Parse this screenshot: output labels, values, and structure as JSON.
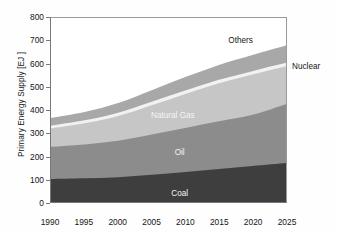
{
  "chart_data": {
    "type": "area",
    "stacked": true,
    "title": "",
    "xlabel": "",
    "ylabel": "Primary Energy Supply [EJ ]",
    "x": [
      1990,
      1995,
      2000,
      2005,
      2010,
      2015,
      2020,
      2025
    ],
    "xlim": [
      1990,
      2025
    ],
    "ylim": [
      0,
      800
    ],
    "yticks": [
      0,
      100,
      200,
      300,
      400,
      500,
      600,
      700,
      800
    ],
    "xticks": [
      1990,
      1995,
      2000,
      2005,
      2010,
      2015,
      2020,
      2025
    ],
    "grid": false,
    "legend": "inline-labels",
    "series": [
      {
        "name": "Coal",
        "color": "#3e3e3e",
        "values": [
          100,
          103,
          108,
          118,
          130,
          143,
          157,
          170
        ]
      },
      {
        "name": "Oil",
        "color": "#8c8c8c",
        "values": [
          140,
          147,
          158,
          175,
          192,
          208,
          222,
          255
        ]
      },
      {
        "name": "Natural Gas",
        "color": "#c6c6c6",
        "values": [
          80,
          92,
          108,
          128,
          148,
          165,
          175,
          165
        ]
      },
      {
        "name": "Nuclear",
        "color": "#f2f2f2",
        "values": [
          12,
          13,
          14,
          15,
          15,
          15,
          15,
          15
        ]
      },
      {
        "name": "Others",
        "color": "#a8a8a8",
        "values": [
          33,
          36,
          42,
          50,
          58,
          65,
          70,
          75
        ]
      }
    ],
    "cumulative_top": {
      "Coal": [
        100,
        103,
        108,
        118,
        130,
        143,
        157,
        170
      ],
      "Oil": [
        240,
        250,
        266,
        293,
        322,
        351,
        379,
        425
      ],
      "Natural Gas": [
        320,
        342,
        374,
        421,
        470,
        516,
        554,
        590
      ],
      "Nuclear": [
        332,
        355,
        388,
        436,
        485,
        531,
        569,
        605
      ],
      "Others": [
        365,
        391,
        430,
        486,
        543,
        596,
        639,
        680
      ]
    },
    "annotations": [
      {
        "text": "Others",
        "x": 2018,
        "y": 705,
        "style": "dark",
        "inside": true
      },
      {
        "text": "Nuclear",
        "x": 2026,
        "y": 610,
        "style": "dark",
        "inside": false
      },
      {
        "text": "Natural Gas",
        "x": 2008,
        "y": 383,
        "style": "light",
        "inside": true
      },
      {
        "text": "Oil",
        "x": 2009,
        "y": 222,
        "style": "light",
        "inside": true
      },
      {
        "text": "Coal",
        "x": 2009,
        "y": 48,
        "style": "light",
        "inside": true
      }
    ]
  },
  "labels": {
    "ylabel": "Primary Energy Supply [EJ ]",
    "others": "Others",
    "nuclear": "Nuclear",
    "natural_gas": "Natural Gas",
    "oil": "Oil",
    "coal": "Coal"
  }
}
